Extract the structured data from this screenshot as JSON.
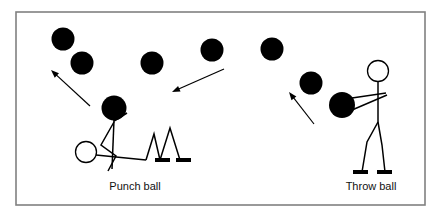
{
  "figure": {
    "background_color": "#ffffff",
    "ink_color": "#000000",
    "frame": {
      "name": "diagram-border",
      "x": 16,
      "y": 12,
      "width": 409,
      "height": 193,
      "stroke": "#808080",
      "stroke_width": 1.6
    },
    "captions": [
      {
        "id": "punch",
        "label": "Punch ball",
        "x": 135,
        "y": 190
      },
      {
        "id": "throw",
        "label": "Throw ball",
        "x": 371,
        "y": 190
      }
    ],
    "balls": [
      {
        "id": "ball-1",
        "cx": 63,
        "cy": 39,
        "r": 11.5
      },
      {
        "id": "ball-2",
        "cx": 82,
        "cy": 63,
        "r": 11.5
      },
      {
        "id": "ball-3",
        "cx": 152,
        "cy": 63,
        "r": 11.5
      },
      {
        "id": "ball-4",
        "cx": 212,
        "cy": 50,
        "r": 11.5
      },
      {
        "id": "ball-5",
        "cx": 272,
        "cy": 49,
        "r": 11.5
      },
      {
        "id": "ball-6",
        "cx": 311,
        "cy": 83,
        "r": 11.5
      },
      {
        "id": "ball-7",
        "cx": 114,
        "cy": 108,
        "r": 12.5
      },
      {
        "id": "ball-8",
        "cx": 342,
        "cy": 105,
        "r": 13.0
      }
    ],
    "arrows": [
      {
        "id": "arrow-left",
        "x1": 90,
        "y1": 106,
        "x2": 51,
        "y2": 70
      },
      {
        "id": "arrow-middle",
        "x1": 224,
        "y1": 69,
        "x2": 172,
        "y2": 92
      },
      {
        "id": "arrow-right",
        "x1": 314,
        "y1": 124,
        "x2": 289,
        "y2": 92
      }
    ],
    "punch_figure": {
      "id": "punch-stick-figure",
      "head": {
        "cx": 86,
        "cy": 152,
        "r": 10.5
      },
      "strokes": [
        "M96,155 L146,160",
        "M114,120 L112,169",
        "M114,122 L101,145 L116,156 L108,171",
        "M114,121 L127,113",
        "M146,160 L154,134 L160,160",
        "M160,160 L170,128 L180,160"
      ],
      "feet": [
        {
          "x": 155,
          "y": 158,
          "w": 15,
          "h": 4
        },
        {
          "x": 176,
          "y": 158,
          "w": 15,
          "h": 4
        }
      ]
    },
    "throw_figure": {
      "id": "throw-stick-figure",
      "head": {
        "cx": 378,
        "cy": 71,
        "r": 10.5
      },
      "strokes": [
        "M378,82 L378,122",
        "M352,98 L386,93",
        "M352,110 L387,95",
        "M378,122 L367,142 L362,172",
        "M378,122 L382,145 L385,172"
      ],
      "feet": [
        {
          "x": 353,
          "y": 170,
          "w": 15,
          "h": 4
        },
        {
          "x": 377,
          "y": 170,
          "w": 15,
          "h": 4
        }
      ]
    }
  }
}
